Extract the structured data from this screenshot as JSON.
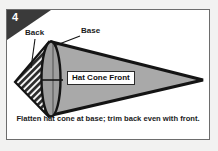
{
  "figure": {
    "step_number": "4",
    "caption": "Flatten hat cone at base; trim back even with front.",
    "labels": {
      "back": "Back",
      "base": "Base",
      "cone_front": "Hat Cone Front"
    },
    "colors": {
      "page_background": "#f2f2f1",
      "panel_background": "#ffffff",
      "panel_border": "#6d6d6d",
      "step_tab_fill": "#3a3a3a",
      "step_number_text": "#ffffff",
      "cone_fill": "#a9a9a9",
      "cone_outline": "#1a1a1a",
      "base_fill": "#9d9d9d",
      "back_hatch_fill": "#2e2e2e",
      "label_text": "#1b1b1b",
      "leader_line": "#1a1a1a"
    },
    "shapes": {
      "cone_front": {
        "name": "hat-cone-front",
        "description": "large flattened cone pointing right",
        "tip_x": 196,
        "tip_y": 70,
        "base_top_x": 46,
        "base_top_y": 32,
        "base_bottom_x": 46,
        "base_bottom_y": 104
      },
      "base_ellipse": {
        "name": "cone-base",
        "cx": 44,
        "cy": 69,
        "rx": 9,
        "ry": 38
      },
      "back_wedge": {
        "name": "hat-cone-back",
        "description": "hatched triangular back wedge at left",
        "hatch_angle_degrees": 45,
        "hatch_spacing_px": 3.2
      }
    }
  }
}
